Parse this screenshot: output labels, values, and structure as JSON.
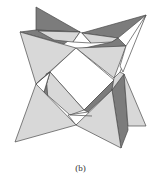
{
  "figure": {
    "caption": "(b)",
    "colors": {
      "light_face": "#d8d8d8",
      "dark_face": "#7c7c7c",
      "edge": "#4a4a4a",
      "background": "#ffffff"
    }
  }
}
